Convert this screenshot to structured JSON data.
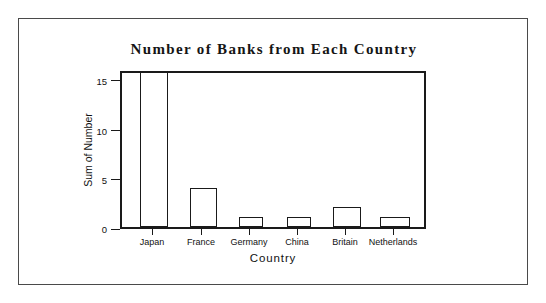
{
  "figure": {
    "background_color": "#ffffff",
    "frame_color": "#4a4a4a",
    "axis_color": "#1a1a1a"
  },
  "chart_data": {
    "type": "bar",
    "title": "Number of Banks from Each Country",
    "xlabel": "Country",
    "ylabel": "Sum of Number",
    "categories": [
      "Japan",
      "France",
      "Germany",
      "China",
      "Britain",
      "Netherlands"
    ],
    "values": [
      16,
      4,
      1,
      1,
      2,
      1
    ],
    "ylim": [
      0,
      16
    ],
    "yticks": [
      0,
      5,
      10,
      15
    ],
    "ytick_labels": [
      "0",
      "5",
      "10",
      "15"
    ],
    "grid": false,
    "legend": null,
    "bar_fill": "#ffffff",
    "bar_edge": "#1a1a1a"
  }
}
